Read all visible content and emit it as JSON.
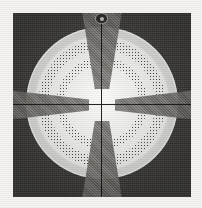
{
  "image": {
    "title": "Circular target reticle scan",
    "type": "scanned-halftone-figure",
    "caption": "Dark square plate containing a white circular disc with a tapered grey cross, two concentric stippled ring bands, crosshair reference lines and a top index notch."
  },
  "canvas": {
    "width_px": 202,
    "height_px": 208,
    "paper_color": "#f4f3f1"
  },
  "plate": {
    "name": "dark-square-plate",
    "left_px": 13,
    "top_px": 13,
    "width_px": 178,
    "height_px": 184,
    "color": "#3a3936"
  },
  "disc": {
    "name": "white-circular-disc",
    "diameter_px": 152,
    "center_x_px": 102,
    "center_y_px": 103,
    "color": "#fbfbf9"
  },
  "rings": [
    {
      "name": "outer-stipple-ring",
      "inner_radius_px": 54,
      "outer_radius_px": 63,
      "fill": "stipple",
      "tone": "#3c3a37"
    },
    {
      "name": "inner-stipple-ring",
      "inner_radius_px": 38,
      "outer_radius_px": 45,
      "fill": "stipple",
      "tone": "#504e4a"
    }
  ],
  "cross": {
    "name": "tapered-grey-cross",
    "color": "#6e6c67",
    "arms": [
      {
        "name": "arm-top",
        "orientation": "vertical",
        "outer_width_px": 40,
        "inner_width_px": 14,
        "length_px": 78
      },
      {
        "name": "arm-bottom",
        "orientation": "vertical",
        "outer_width_px": 40,
        "inner_width_px": 14,
        "length_px": 78
      },
      {
        "name": "arm-left",
        "orientation": "horizontal",
        "outer_width_px": 34,
        "inner_width_px": 11,
        "length_px": 100
      },
      {
        "name": "arm-right",
        "orientation": "horizontal",
        "outer_width_px": 34,
        "inner_width_px": 11,
        "length_px": 100
      }
    ]
  },
  "crosshair": {
    "name": "reference-crosshair",
    "color": "#141413",
    "line_width_px": 1,
    "vertical": true,
    "horizontal": true
  },
  "notch": {
    "name": "top-index-notch",
    "position": "top-center",
    "width_px": 11,
    "height_px": 9,
    "color": "#2a2927",
    "highlight_color": "#cfcdc6"
  }
}
